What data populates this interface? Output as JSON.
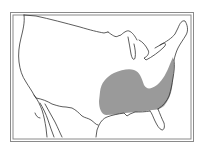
{
  "map": {
    "subject": "continental-united-states",
    "style": "line-drawing range map",
    "colors": {
      "background": "#ffffff",
      "outline": "#333333",
      "frame": "#777777",
      "range_fill": "#9a9a9a"
    },
    "regions": [
      {
        "name": "range-area",
        "description": "shaded distribution range covering the southeastern United States"
      }
    ]
  }
}
